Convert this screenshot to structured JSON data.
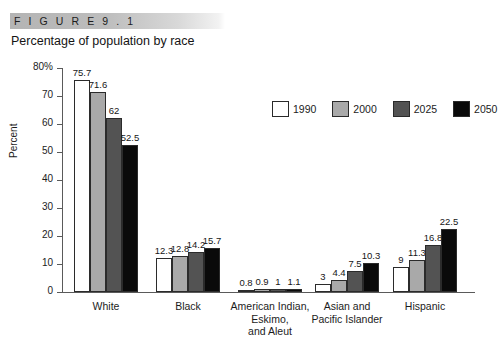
{
  "figure": {
    "label": "F I G U R E   9 . 1",
    "subtitle": "Percentage of population by race"
  },
  "chart_data": {
    "type": "bar",
    "title": "Percentage of population by race",
    "xlabel": "",
    "ylabel": "Percent",
    "ylim": [
      0,
      80
    ],
    "yticks": [
      "0",
      "10",
      "20",
      "30",
      "40",
      "50",
      "60",
      "70",
      "80%"
    ],
    "ytick_values": [
      0,
      10,
      20,
      30,
      40,
      50,
      60,
      70,
      80
    ],
    "grid": false,
    "legend_position": "top-right",
    "categories": [
      "White",
      "Black",
      "American Indian,\nEskimo,\nand Aleut",
      "Asian and\nPacific Islander",
      "Hispanic"
    ],
    "series": [
      {
        "name": "1990",
        "color": "#ffffff",
        "values": [
          75.7,
          12.3,
          0.8,
          3,
          9
        ],
        "labels": [
          "75.7",
          "12.3",
          "0.8",
          "3",
          "9"
        ]
      },
      {
        "name": "2000",
        "color": "#a9a9a9",
        "values": [
          71.6,
          12.8,
          0.9,
          4.4,
          11.3
        ],
        "labels": [
          "71.6",
          "12.8",
          "0.9",
          "4.4",
          "11.3"
        ]
      },
      {
        "name": "2025",
        "color": "#535353",
        "values": [
          62,
          14.2,
          1,
          7.5,
          16.8
        ],
        "labels": [
          "62",
          "14.2",
          "1",
          "7.5",
          "16.8"
        ]
      },
      {
        "name": "2050",
        "color": "#0a0a0a",
        "values": [
          52.5,
          15.7,
          1.1,
          10.3,
          22.5
        ],
        "labels": [
          "52.5",
          "15.7",
          "1.1",
          "10.3",
          "22.5"
        ]
      }
    ]
  }
}
